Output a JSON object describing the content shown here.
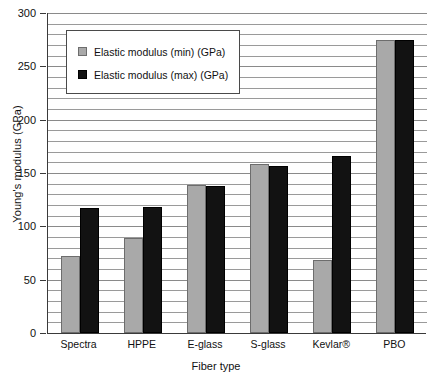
{
  "chart_data": {
    "type": "bar",
    "title": "",
    "xlabel": "Fiber type",
    "ylabel": "Young's modulus (GPa)",
    "ylim": [
      0,
      300
    ],
    "y_major_step": 50,
    "y_minor_step": 10,
    "grid": true,
    "legend_position": "upper-left-inside",
    "categories": [
      "Spectra",
      "HPPE",
      "E-glass",
      "S-glass",
      "Kevlar®",
      "PBO"
    ],
    "y_tick_labels": [
      "0",
      "50",
      "100",
      "150",
      "200",
      "250",
      "300"
    ],
    "series": [
      {
        "name": "Elastic modulus (min) (GPa)",
        "color": "#a9a9a9",
        "values": [
          72,
          89,
          139,
          158,
          68,
          275
        ]
      },
      {
        "name": "Elastic modulus (max) (GPa)",
        "color": "#121212",
        "values": [
          117,
          118,
          138,
          157,
          166,
          275
        ]
      }
    ]
  },
  "legend": {
    "items": [
      {
        "label": "Elastic modulus (min) (GPa)",
        "swatch": "min"
      },
      {
        "label": "Elastic modulus (max) (GPa)",
        "swatch": "max"
      }
    ]
  }
}
